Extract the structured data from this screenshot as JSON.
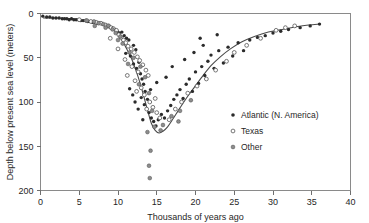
{
  "chart_data": {
    "type": "scatter",
    "title": "",
    "xlabel": "Thousands of years ago",
    "ylabel": "Depth below present  sea level (meters)",
    "xlim": [
      0,
      40
    ],
    "ylim": [
      200,
      0
    ],
    "y_inverted": true,
    "grid": false,
    "legend_position": "middle-right",
    "xticks": [
      0,
      5,
      10,
      15,
      20,
      25,
      30,
      35,
      40
    ],
    "xticklabels": [
      "0",
      "5",
      "10",
      "15",
      "20",
      "25",
      "30",
      "35",
      "40"
    ],
    "yticks": [
      0,
      50,
      100,
      150,
      200
    ],
    "yticklabels": [
      "0",
      "50",
      "100",
      "150",
      "200"
    ],
    "series": [
      {
        "name": "Atlantic (N. America)",
        "marker": "filled-circle",
        "color": "#2b2b2b",
        "points": [
          [
            0.3,
            3
          ],
          [
            0.8,
            4
          ],
          [
            1.2,
            4
          ],
          [
            1.6,
            5
          ],
          [
            2.0,
            5
          ],
          [
            2.4,
            5
          ],
          [
            2.8,
            6
          ],
          [
            3.1,
            6
          ],
          [
            3.4,
            6
          ],
          [
            3.7,
            7
          ],
          [
            4.0,
            6
          ],
          [
            4.3,
            7
          ],
          [
            4.6,
            7
          ],
          [
            4.9,
            7
          ],
          [
            5.2,
            8
          ],
          [
            5.5,
            8
          ],
          [
            5.8,
            8
          ],
          [
            6.1,
            9
          ],
          [
            6.4,
            9
          ],
          [
            6.7,
            10
          ],
          [
            7.0,
            10
          ],
          [
            7.3,
            11
          ],
          [
            7.6,
            11
          ],
          [
            8.0,
            12
          ],
          [
            8.3,
            13
          ],
          [
            8.6,
            14
          ],
          [
            8.9,
            15
          ],
          [
            9.2,
            16
          ],
          [
            9.6,
            18
          ],
          [
            9.9,
            20
          ],
          [
            10.2,
            22
          ],
          [
            10.5,
            21
          ],
          [
            10.8,
            25
          ],
          [
            11.1,
            28
          ],
          [
            11.4,
            30
          ],
          [
            11.0,
            45
          ],
          [
            11.6,
            48
          ],
          [
            12.0,
            36
          ],
          [
            12.3,
            41
          ],
          [
            12.0,
            57
          ],
          [
            12.4,
            62
          ],
          [
            12.7,
            55
          ],
          [
            12.9,
            68
          ],
          [
            13.1,
            74
          ],
          [
            13.3,
            80
          ],
          [
            13.5,
            88
          ],
          [
            13.0,
            95
          ],
          [
            13.4,
            103
          ],
          [
            12.6,
            108
          ],
          [
            13.8,
            97
          ],
          [
            14.0,
            112
          ],
          [
            14.3,
            118
          ],
          [
            14.6,
            122
          ],
          [
            13.2,
            120
          ],
          [
            12.2,
            100
          ],
          [
            11.9,
            92
          ],
          [
            11.5,
            85
          ],
          [
            14.9,
            127
          ],
          [
            15.2,
            120
          ],
          [
            15.6,
            114
          ],
          [
            16.0,
            118
          ],
          [
            16.4,
            110
          ],
          [
            16.8,
            104
          ],
          [
            17.2,
            97
          ],
          [
            17.6,
            92
          ],
          [
            18.0,
            86
          ],
          [
            18.4,
            96
          ],
          [
            18.8,
            80
          ],
          [
            19.2,
            74
          ],
          [
            19.6,
            88
          ],
          [
            20.0,
            66
          ],
          [
            20.4,
            79
          ],
          [
            20.8,
            60
          ],
          [
            21.2,
            70
          ],
          [
            21.6,
            54
          ],
          [
            22.0,
            47
          ],
          [
            22.4,
            62
          ],
          [
            23.0,
            42
          ],
          [
            23.6,
            56
          ],
          [
            24.2,
            38
          ],
          [
            24.8,
            48
          ],
          [
            25.5,
            33
          ],
          [
            26.2,
            42
          ],
          [
            27.0,
            30
          ],
          [
            28.0,
            27
          ],
          [
            29.0,
            25
          ],
          [
            30.0,
            22
          ],
          [
            31.0,
            20
          ],
          [
            32.0,
            18
          ],
          [
            33.5,
            16
          ],
          [
            34.8,
            14
          ],
          [
            36.0,
            12
          ],
          [
            16.2,
            72
          ],
          [
            17.0,
            60
          ],
          [
            18.6,
            52
          ],
          [
            19.8,
            44
          ],
          [
            21.0,
            36
          ],
          [
            15.0,
            78
          ],
          [
            14.2,
            86
          ],
          [
            20.6,
            28
          ],
          [
            22.8,
            24
          ]
        ]
      },
      {
        "name": "Texas",
        "marker": "open-circle",
        "color": "#ffffff",
        "points": [
          [
            5.0,
            7
          ],
          [
            5.9,
            8
          ],
          [
            6.5,
            9
          ],
          [
            7.2,
            10
          ],
          [
            7.8,
            11
          ],
          [
            8.4,
            13
          ],
          [
            8.8,
            14
          ],
          [
            9.1,
            16
          ],
          [
            9.4,
            17
          ],
          [
            9.8,
            19
          ],
          [
            10.1,
            24
          ],
          [
            10.4,
            27
          ],
          [
            10.7,
            30
          ],
          [
            11.0,
            33
          ],
          [
            11.3,
            37
          ],
          [
            11.7,
            40
          ],
          [
            12.1,
            44
          ],
          [
            12.5,
            49
          ],
          [
            12.8,
            53
          ],
          [
            13.2,
            58
          ],
          [
            10.9,
            52
          ],
          [
            11.8,
            60
          ],
          [
            12.6,
            66
          ],
          [
            13.6,
            64
          ],
          [
            13.9,
            70
          ],
          [
            11.2,
            70
          ],
          [
            12.2,
            76
          ],
          [
            13.0,
            84
          ],
          [
            13.4,
            92
          ],
          [
            12.4,
            88
          ],
          [
            14.1,
            100
          ],
          [
            13.7,
            108
          ],
          [
            14.5,
            106
          ],
          [
            15.0,
            112
          ],
          [
            15.4,
            118
          ],
          [
            16.6,
            120
          ],
          [
            17.4,
            108
          ],
          [
            18.2,
            100
          ],
          [
            19.0,
            90
          ],
          [
            20.2,
            82
          ],
          [
            21.4,
            74
          ],
          [
            22.6,
            64
          ],
          [
            24.0,
            54
          ],
          [
            25.0,
            44
          ],
          [
            26.6,
            36
          ],
          [
            28.4,
            28
          ],
          [
            30.4,
            19
          ],
          [
            31.6,
            16
          ],
          [
            32.8,
            14
          ],
          [
            9.0,
            28
          ],
          [
            10.0,
            40
          ],
          [
            14.8,
            96
          ]
        ]
      },
      {
        "name": "Other",
        "marker": "half-filled-circle",
        "color": "#8d8d8d",
        "points": [
          [
            6.0,
            8
          ],
          [
            6.9,
            9
          ],
          [
            7.5,
            11
          ],
          [
            8.1,
            12
          ],
          [
            8.7,
            14
          ],
          [
            9.3,
            18
          ],
          [
            9.7,
            22
          ],
          [
            10.3,
            26
          ],
          [
            10.6,
            34
          ],
          [
            11.5,
            44
          ],
          [
            12.0,
            50
          ],
          [
            12.9,
            60
          ],
          [
            13.5,
            72
          ],
          [
            14.0,
            90
          ],
          [
            14.4,
            110
          ],
          [
            14.7,
            128
          ],
          [
            13.8,
            134
          ],
          [
            14.2,
            155
          ],
          [
            14.0,
            172
          ],
          [
            14.1,
            186
          ],
          [
            15.8,
            126
          ],
          [
            16.9,
            116
          ],
          [
            18.0,
            110
          ],
          [
            19.4,
            98
          ],
          [
            11.3,
            57
          ],
          [
            12.7,
            80
          ],
          [
            15.5,
            132
          ],
          [
            17.8,
            122
          ],
          [
            10.0,
            30
          ],
          [
            8.4,
            16
          ],
          [
            7.0,
            14
          ]
        ]
      }
    ],
    "trend_line": {
      "name": "fitted-sea-level-curve",
      "description": "smooth curve from near 0 m at 0 kyr descending to ~135 m minimum near 14.5 kyr then rising to ~12 m at 36 kyr",
      "points": [
        [
          0.4,
          5
        ],
        [
          2.0,
          5
        ],
        [
          4.0,
          6
        ],
        [
          6.0,
          8
        ],
        [
          7.5,
          10
        ],
        [
          8.5,
          13
        ],
        [
          9.5,
          19
        ],
        [
          10.3,
          27
        ],
        [
          11.0,
          38
        ],
        [
          11.7,
          50
        ],
        [
          12.3,
          64
        ],
        [
          12.9,
          80
        ],
        [
          13.4,
          96
        ],
        [
          13.9,
          112
        ],
        [
          14.3,
          124
        ],
        [
          14.8,
          132
        ],
        [
          15.3,
          135
        ],
        [
          15.8,
          133
        ],
        [
          16.4,
          128
        ],
        [
          17.1,
          119
        ],
        [
          17.9,
          108
        ],
        [
          18.8,
          96
        ],
        [
          19.8,
          84
        ],
        [
          20.9,
          71
        ],
        [
          22.0,
          59
        ],
        [
          23.2,
          49
        ],
        [
          24.5,
          40
        ],
        [
          26.0,
          32
        ],
        [
          27.6,
          26
        ],
        [
          29.4,
          21
        ],
        [
          31.2,
          18
        ],
        [
          33.0,
          15
        ],
        [
          34.6,
          13
        ],
        [
          36.0,
          12
        ]
      ]
    }
  },
  "legend": {
    "items": [
      {
        "label": "Atlantic (N. America)",
        "marker": "filled-circle"
      },
      {
        "label": "Texas",
        "marker": "open-circle"
      },
      {
        "label": "Other",
        "marker": "half-filled-circle"
      }
    ]
  }
}
